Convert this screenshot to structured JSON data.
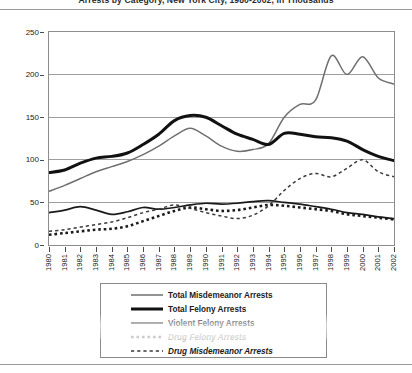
{
  "chart_data": {
    "type": "line",
    "title": "Arrests by Category, New York City, 1980-2002, in Thousands",
    "xlabel": "",
    "ylabel": "",
    "ylim": [
      0,
      250
    ],
    "yticks": [
      0,
      50,
      100,
      150,
      200,
      250
    ],
    "grid": true,
    "legend_position": "below-plot",
    "x": [
      1980,
      1981,
      1982,
      1983,
      1984,
      1985,
      1986,
      1987,
      1988,
      1989,
      1990,
      1991,
      1992,
      1993,
      1994,
      1995,
      1996,
      1997,
      1998,
      1999,
      2000,
      2001,
      2002
    ],
    "categories": [
      "1980",
      "1981",
      "1982",
      "1983",
      "1984",
      "1985",
      "1986",
      "1987",
      "1988",
      "1989",
      "1990",
      "1991",
      "1992",
      "1993",
      "1994",
      "1995",
      "1996",
      "1997",
      "1998",
      "1999",
      "2000",
      "2001",
      "2002"
    ],
    "series": [
      {
        "name": "Total Misdemeanor Arrests",
        "style": "solid-thin-gray",
        "color": "#6f6f6f",
        "values": [
          63,
          70,
          78,
          86,
          92,
          98,
          106,
          116,
          128,
          137,
          128,
          116,
          110,
          112,
          119,
          150,
          165,
          170,
          222,
          200,
          221,
          196,
          189
        ]
      },
      {
        "name": "Total Felony Arrests",
        "style": "solid-thick-black",
        "color": "#111111",
        "values": [
          85,
          88,
          96,
          102,
          104,
          108,
          118,
          130,
          146,
          152,
          150,
          140,
          130,
          124,
          118,
          131,
          130,
          127,
          126,
          122,
          112,
          104,
          99
        ]
      },
      {
        "name": "Violent Felony Arrests",
        "style": "solid-medium-black",
        "color": "#1a1a1a",
        "values": [
          38,
          41,
          45,
          41,
          36,
          39,
          44,
          42,
          44,
          47,
          49,
          48,
          49,
          51,
          52,
          50,
          48,
          45,
          42,
          38,
          36,
          33,
          31
        ]
      },
      {
        "name": "Drug Felony Arrests",
        "style": "dotted-square",
        "color": "#1a1a1a",
        "values": [
          12,
          14,
          16,
          18,
          19,
          22,
          28,
          34,
          40,
          44,
          42,
          40,
          41,
          44,
          47,
          46,
          44,
          42,
          40,
          36,
          34,
          32,
          30
        ]
      },
      {
        "name": "Drug Misdemeanor Arrests",
        "style": "dashed",
        "color": "#3a3a3a",
        "values": [
          16,
          18,
          21,
          24,
          27,
          32,
          38,
          42,
          47,
          43,
          38,
          34,
          31,
          35,
          46,
          64,
          78,
          84,
          80,
          90,
          100,
          86,
          80
        ]
      }
    ]
  },
  "y_axis": {
    "ticks": [
      "0",
      "50",
      "100",
      "150",
      "200",
      "250"
    ]
  },
  "legend": {
    "items": [
      {
        "label": "Total Misdemeanor Arrests"
      },
      {
        "label": "Total Felony Arrests"
      },
      {
        "label": "Violent Felony Arrests"
      },
      {
        "label": "Drug Felony Arrests"
      },
      {
        "label": "Drug Misdemeanor Arrests"
      }
    ]
  }
}
